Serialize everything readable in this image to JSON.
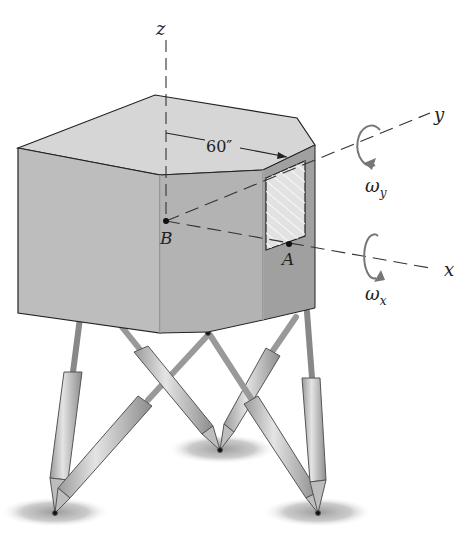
{
  "figure": {
    "axes": {
      "z": "z",
      "y": "y",
      "x": "x"
    },
    "points": {
      "B": "B",
      "A": "A"
    },
    "dimension": "60″",
    "angular_velocities": {
      "omega_y": {
        "symbol": "ω",
        "subscript": "y"
      },
      "omega_x": {
        "symbol": "ω",
        "subscript": "x"
      }
    }
  },
  "colors": {
    "body_top": "#d6d6d6",
    "body_left": "#bdbdbd",
    "body_front": "#b0b0b0",
    "body_right": "#9c9c9c",
    "window": "#e2e2e2",
    "strut": "#c4c4c4",
    "shadow": "#9a9a9a",
    "line": "#222222"
  }
}
